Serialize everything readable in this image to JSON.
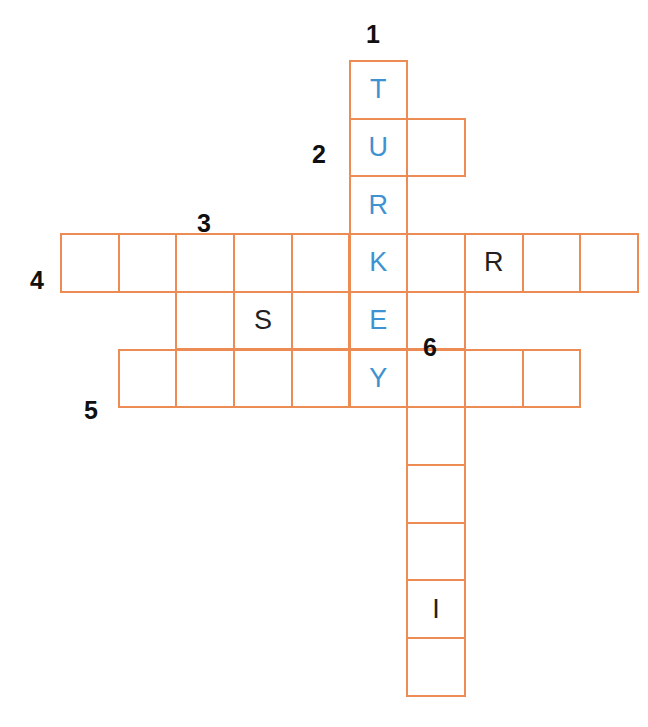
{
  "puzzle": {
    "title": "Crossword grid",
    "grid_origin": {
      "x": 60,
      "y": 60
    },
    "cell_size": 57.7,
    "colors": {
      "cell_border": "#ed8b55",
      "given_letter": "#3f92d2",
      "filled_letter": "#231f20",
      "clue_number": "#101010",
      "background": "#ffffff"
    },
    "clue_numbers": [
      {
        "label": "1",
        "x": 366,
        "y": 22
      },
      {
        "label": "2",
        "x": 312,
        "y": 142
      },
      {
        "label": "3",
        "x": 197,
        "y": 211
      },
      {
        "label": "4",
        "x": 30,
        "y": 268
      },
      {
        "label": "5",
        "x": 84,
        "y": 398
      },
      {
        "label": "6",
        "x": 423,
        "y": 335
      }
    ],
    "entries": [
      {
        "name": "entry-1-down",
        "number": "1",
        "direction": "down",
        "start_col": 6,
        "start_row": 1,
        "length": 6,
        "answer": "TURKEY",
        "letters": [
          "T",
          "U",
          "R",
          "K",
          "E",
          "Y"
        ]
      },
      {
        "name": "entry-2-across",
        "number": "2",
        "direction": "across",
        "start_col": 6,
        "start_row": 2,
        "length": 2,
        "letters": [
          "U",
          ""
        ]
      },
      {
        "name": "entry-3-down",
        "number": "3",
        "direction": "down",
        "start_col": 4,
        "start_row": 4,
        "length": 3,
        "letters": [
          "",
          "S",
          ""
        ]
      },
      {
        "name": "entry-4-across",
        "number": "4",
        "direction": "across",
        "start_col": 1,
        "start_row": 4,
        "length": 10,
        "letters": [
          "",
          "",
          "",
          "",
          "",
          "K",
          "",
          "R",
          "",
          ""
        ]
      },
      {
        "name": "entry-5-across",
        "number": "5",
        "direction": "across",
        "start_col": 2,
        "start_row": 6,
        "length": 8,
        "letters": [
          "",
          "",
          "",
          "",
          "Y",
          "",
          "",
          ""
        ]
      },
      {
        "name": "entry-6-down",
        "number": "6",
        "direction": "down",
        "start_col": 7,
        "start_row": 5,
        "length": 7,
        "letters": [
          "",
          "",
          "",
          "",
          "",
          "I",
          ""
        ]
      }
    ],
    "cells": [
      {
        "id": "c6r1",
        "col": 6,
        "row": 1,
        "letter": "T",
        "state": "given"
      },
      {
        "id": "c6r2",
        "col": 6,
        "row": 2,
        "letter": "U",
        "state": "given"
      },
      {
        "id": "c7r2",
        "col": 7,
        "row": 2,
        "letter": "",
        "state": "empty"
      },
      {
        "id": "c6r3",
        "col": 6,
        "row": 3,
        "letter": "R",
        "state": "given"
      },
      {
        "id": "c1r4",
        "col": 1,
        "row": 4,
        "letter": "",
        "state": "empty"
      },
      {
        "id": "c2r4",
        "col": 2,
        "row": 4,
        "letter": "",
        "state": "empty"
      },
      {
        "id": "c3r4",
        "col": 3,
        "row": 4,
        "letter": "",
        "state": "empty"
      },
      {
        "id": "c4r4",
        "col": 4,
        "row": 4,
        "letter": "",
        "state": "empty"
      },
      {
        "id": "c5r4",
        "col": 5,
        "row": 4,
        "letter": "",
        "state": "empty"
      },
      {
        "id": "c6r4",
        "col": 6,
        "row": 4,
        "letter": "K",
        "state": "given"
      },
      {
        "id": "c7r4",
        "col": 7,
        "row": 4,
        "letter": "",
        "state": "empty"
      },
      {
        "id": "c8r4",
        "col": 8,
        "row": 4,
        "letter": "R",
        "state": "filled"
      },
      {
        "id": "c9r4",
        "col": 9,
        "row": 4,
        "letter": "",
        "state": "empty"
      },
      {
        "id": "c10r4",
        "col": 10,
        "row": 4,
        "letter": "",
        "state": "empty"
      },
      {
        "id": "c3r5",
        "col": 3,
        "row": 5,
        "letter": "",
        "state": "empty"
      },
      {
        "id": "c4r5",
        "col": 4,
        "row": 5,
        "letter": "S",
        "state": "filled"
      },
      {
        "id": "c5r5",
        "col": 5,
        "row": 5,
        "letter": "",
        "state": "empty"
      },
      {
        "id": "c6r5",
        "col": 6,
        "row": 5,
        "letter": "E",
        "state": "given"
      },
      {
        "id": "c7r5",
        "col": 7,
        "row": 5,
        "letter": "",
        "state": "empty"
      },
      {
        "id": "c2r6",
        "col": 2,
        "row": 6,
        "letter": "",
        "state": "empty"
      },
      {
        "id": "c3r6",
        "col": 3,
        "row": 6,
        "letter": "",
        "state": "empty"
      },
      {
        "id": "c4r6",
        "col": 4,
        "row": 6,
        "letter": "",
        "state": "empty"
      },
      {
        "id": "c5r6",
        "col": 5,
        "row": 6,
        "letter": "",
        "state": "empty"
      },
      {
        "id": "c6r6",
        "col": 6,
        "row": 6,
        "letter": "Y",
        "state": "given"
      },
      {
        "id": "c7r6",
        "col": 7,
        "row": 6,
        "letter": "",
        "state": "empty"
      },
      {
        "id": "c8r6",
        "col": 8,
        "row": 6,
        "letter": "",
        "state": "empty"
      },
      {
        "id": "c9r6",
        "col": 9,
        "row": 6,
        "letter": "",
        "state": "empty"
      },
      {
        "id": "c7r7",
        "col": 7,
        "row": 7,
        "letter": "",
        "state": "empty"
      },
      {
        "id": "c7r8",
        "col": 7,
        "row": 8,
        "letter": "",
        "state": "empty"
      },
      {
        "id": "c7r9",
        "col": 7,
        "row": 9,
        "letter": "",
        "state": "empty"
      },
      {
        "id": "c7r10",
        "col": 7,
        "row": 10,
        "letter": "I",
        "state": "filled"
      },
      {
        "id": "c7r11",
        "col": 7,
        "row": 11,
        "letter": "",
        "state": "empty"
      }
    ]
  }
}
